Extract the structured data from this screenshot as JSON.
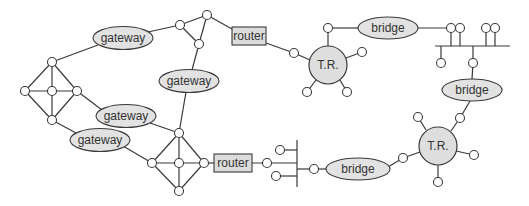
{
  "diagram": {
    "title": "",
    "colors": {
      "stroke": "#3a3a3a",
      "ellipse_fill": "#e2e2e2",
      "token_ring_fill": "#dedede",
      "router_fill": "#dcdcdc",
      "node_fill": "#ffffff",
      "background": "#ffffff"
    },
    "labels": {
      "gateway_top": "gateway",
      "gateway_middle": "gateway",
      "gateway_mid_left": "gateway",
      "gateway_lower_left": "gateway",
      "router_top": "router",
      "router_bottom": "router",
      "token_ring_top": "T.R.",
      "token_ring_bottom": "T.R.",
      "bridge_top": "bridge",
      "bridge_right": "bridge",
      "bridge_bottom": "bridge"
    },
    "components": [
      {
        "id": "mesh-left",
        "type": "mesh",
        "nodes": 5
      },
      {
        "id": "triangle-top",
        "type": "mesh",
        "nodes": 3
      },
      {
        "id": "mesh-bottom",
        "type": "mesh",
        "nodes": 5
      },
      {
        "id": "gateway-top",
        "type": "gateway",
        "label": "gateway",
        "connects": [
          "mesh-left",
          "triangle-top"
        ]
      },
      {
        "id": "gateway-middle",
        "type": "gateway",
        "label": "gateway",
        "connects": [
          "triangle-top",
          "mesh-bottom"
        ]
      },
      {
        "id": "gateway-mid-left",
        "type": "gateway",
        "label": "gateway",
        "connects": [
          "mesh-left",
          "mesh-bottom"
        ]
      },
      {
        "id": "gateway-lower-left",
        "type": "gateway",
        "label": "gateway",
        "connects": [
          "mesh-left",
          "mesh-bottom"
        ]
      },
      {
        "id": "router-top",
        "type": "router",
        "label": "router",
        "connects": [
          "triangle-top",
          "token-ring-top"
        ]
      },
      {
        "id": "router-bottom",
        "type": "router",
        "label": "router",
        "connects": [
          "mesh-bottom",
          "bus-bottom"
        ]
      },
      {
        "id": "token-ring-top",
        "type": "token-ring",
        "label": "T.R.",
        "stations": 5
      },
      {
        "id": "token-ring-bottom",
        "type": "token-ring",
        "label": "T.R.",
        "stations": 5
      },
      {
        "id": "bridge-top",
        "type": "bridge",
        "label": "bridge",
        "connects": [
          "token-ring-top",
          "bus-top"
        ]
      },
      {
        "id": "bridge-right",
        "type": "bridge",
        "label": "bridge",
        "connects": [
          "bus-top",
          "token-ring-bottom"
        ]
      },
      {
        "id": "bridge-bottom",
        "type": "bridge",
        "label": "bridge",
        "connects": [
          "bus-bottom",
          "token-ring-bottom"
        ]
      },
      {
        "id": "bus-top",
        "type": "bus",
        "stations": 7
      },
      {
        "id": "bus-bottom",
        "type": "bus",
        "stations": 4
      }
    ]
  }
}
